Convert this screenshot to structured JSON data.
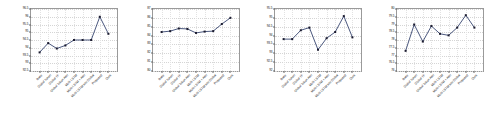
{
  "figure": {
    "background": "#ffffff",
    "panel_count": 4,
    "shared_xlabels": [
      "Base",
      "Global Token",
      "Global TF",
      "Global Token Attn",
      "Multi-LSTM",
      "Multi-LSTM + Attn",
      "Multi-LSTM w/o Global",
      "Proposed",
      "Ours"
    ]
  },
  "chart_data": [
    {
      "type": "line",
      "title": "(a)",
      "xlabel": "",
      "ylabel": "",
      "categories": [
        "Base",
        "Global Token",
        "Global TF",
        "Global Token Attn",
        "Multi-LSTM",
        "Multi-LSTM + Attn",
        "Multi-LSTM w/o Global",
        "Proposed",
        "Ours"
      ],
      "values": [
        93.7,
        94.3,
        93.95,
        94.15,
        94.5,
        94.5,
        94.5,
        96.0,
        94.9
      ],
      "ylim": [
        92.5,
        96.5
      ],
      "yticks": [
        92.5,
        93.0,
        93.5,
        94.0,
        94.5,
        95.0,
        95.5,
        96.0,
        96.5
      ],
      "ytick_labels": [
        "92.5",
        "93",
        "93.5",
        "94",
        "94.5",
        "95",
        "95.5",
        "96",
        "96.5"
      ],
      "grid": true,
      "legend": "none",
      "line_color": "#2b3a67",
      "marker": "square",
      "marker_color": "#1b1b2f"
    },
    {
      "type": "line",
      "title": "(b)",
      "xlabel": "",
      "ylabel": "",
      "categories": [
        "Base",
        "Global Token",
        "Global TF",
        "Global Token Attn",
        "Multi-LSTM",
        "Multi-LSTM + Attn",
        "Multi-LSTM w/o Global",
        "Proposed",
        "Ours"
      ],
      "values": [
        84.4,
        84.5,
        84.8,
        84.75,
        84.3,
        84.45,
        84.5,
        85.3,
        86.0
      ],
      "ylim": [
        80.0,
        87.0
      ],
      "yticks": [
        80,
        81,
        82,
        83,
        84,
        85,
        86,
        87
      ],
      "ytick_labels": [
        "80",
        "81",
        "82",
        "83",
        "84",
        "85",
        "86",
        "87"
      ],
      "grid": true,
      "legend": "none",
      "line_color": "#2b3a67",
      "marker": "square",
      "marker_color": "#1b1b2f"
    },
    {
      "type": "line",
      "title": "(c)",
      "xlabel": "",
      "ylabel": "",
      "categories": [
        "Base",
        "Global Token",
        "Global TF",
        "Global Token Attn",
        "Multi-LSTM",
        "Multi-LSTM + Attn",
        "Multi-LSTM w/o Global",
        "Proposed",
        "Ours"
      ],
      "values": [
        93.8,
        93.8,
        94.3,
        94.45,
        93.2,
        93.85,
        94.2,
        95.1,
        93.9
      ],
      "ylim": [
        92.0,
        95.5
      ],
      "yticks": [
        92.0,
        92.5,
        93.0,
        93.5,
        94.0,
        94.5,
        95.0,
        95.5
      ],
      "ytick_labels": [
        "92",
        "92.5",
        "93",
        "93.5",
        "94",
        "94.5",
        "95",
        "95.5"
      ],
      "grid": true,
      "legend": "none",
      "line_color": "#2b3a67",
      "marker": "square",
      "marker_color": "#1b1b2f"
    },
    {
      "type": "line",
      "title": "(d)",
      "xlabel": "",
      "ylabel": "",
      "categories": [
        "Base",
        "Global Token",
        "Global TF",
        "Global Token Attn",
        "Multi-LSTM",
        "Multi-LSTM + Attn",
        "Multi-LSTM w/o Global",
        "Proposed",
        "Ours"
      ],
      "values": [
        77.3,
        79.0,
        77.9,
        78.9,
        78.4,
        78.3,
        78.8,
        79.6,
        78.8
      ],
      "ylim": [
        76.0,
        80.0
      ],
      "yticks": [
        76.0,
        76.5,
        77.0,
        77.5,
        78.0,
        78.5,
        79.0,
        79.5,
        80.0
      ],
      "ytick_labels": [
        "76",
        "76.5",
        "77",
        "77.5",
        "78",
        "78.5",
        "79",
        "79.5",
        "80"
      ],
      "grid": true,
      "legend": "none",
      "line_color": "#2b3a67",
      "marker": "square",
      "marker_color": "#1b1b2f"
    }
  ]
}
